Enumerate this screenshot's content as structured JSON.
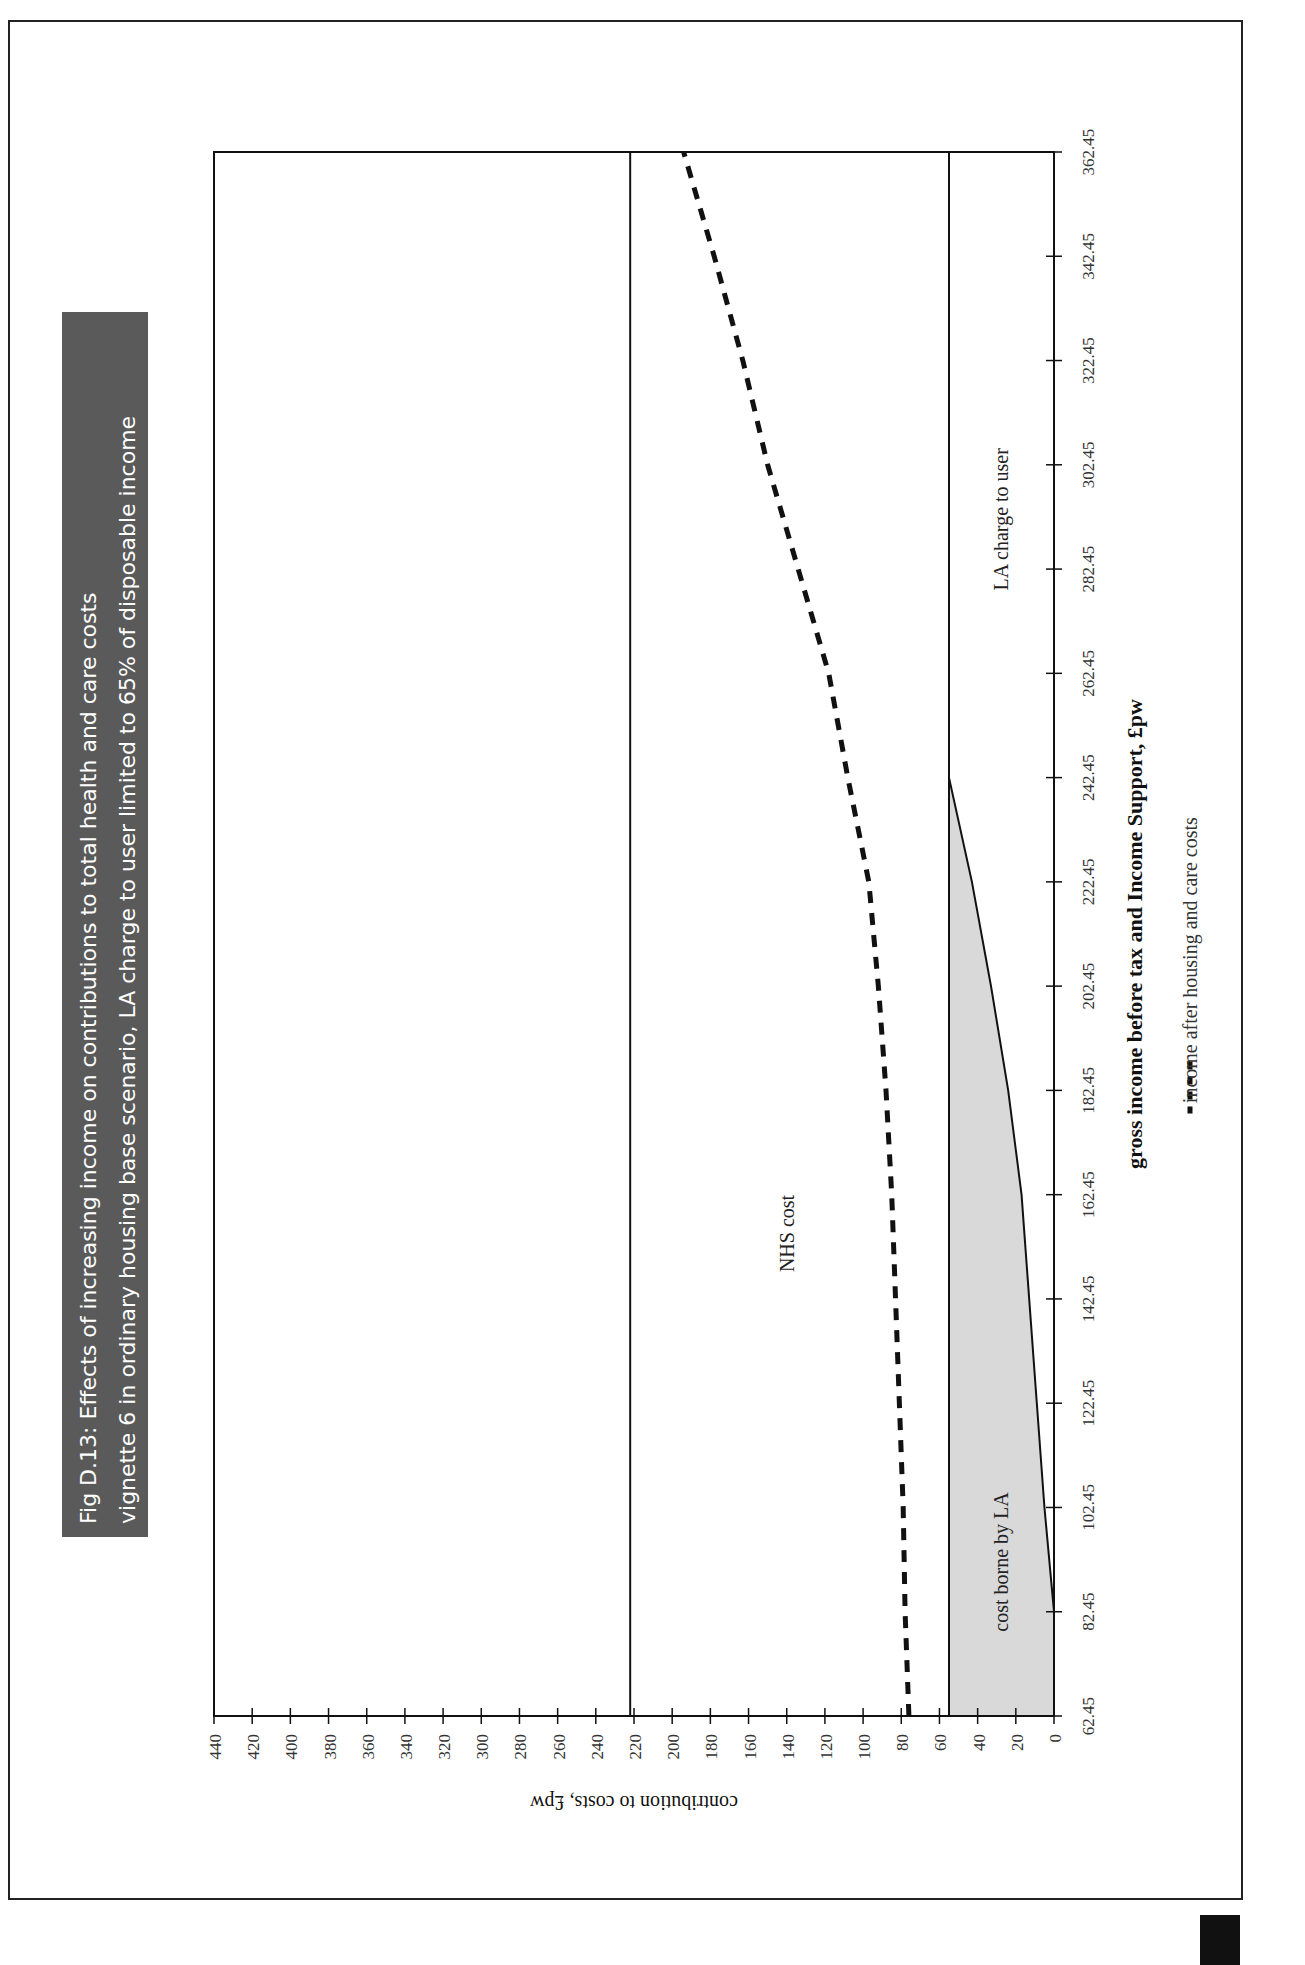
{
  "figure": {
    "title_line1": "Fig D.13:  Effects of increasing income on contributions to total health and care costs",
    "title_line2": "vignette 6 in ordinary housing base scenario, LA charge to user limited to 65% of disposable income",
    "title_bg_color": "#5a5a5a",
    "title_text_color": "#ffffff"
  },
  "labels": {
    "nhs_cost": "NHS cost",
    "la_charge": "LA charge to user",
    "cost_borne_by_la": "cost borne by LA",
    "legend_dashed": "income after housing and care costs",
    "legend_symbol": "- - - -"
  },
  "chart_data": {
    "type": "area",
    "orientation": "rotated 90° counter-clockwise on page",
    "title": "Fig D.13: Effects of increasing income on contributions to total health and care costs vignette 6 in ordinary housing base scenario, LA charge to user limited to 65% of disposable income",
    "xlabel": "gross income before tax and Income Support, £pw",
    "ylabel": "contribution to costs, £pw",
    "x_ticks": [
      "62.45",
      "82.45",
      "102.45",
      "122.45",
      "142.45",
      "162.45",
      "182.45",
      "202.45",
      "222.45",
      "242.45",
      "262.45",
      "282.45",
      "302.45",
      "322.45",
      "342.45",
      "362.45"
    ],
    "y_ticks": [
      "0",
      "20",
      "40",
      "60",
      "80",
      "100",
      "120",
      "140",
      "160",
      "180",
      "200",
      "220",
      "240",
      "260",
      "280",
      "300",
      "320",
      "340",
      "360",
      "380",
      "400",
      "420",
      "440"
    ],
    "xlim": [
      62.45,
      362.45
    ],
    "ylim": [
      0,
      440
    ],
    "x": [
      62.45,
      82.45,
      102.45,
      122.45,
      142.45,
      162.45,
      182.45,
      202.45,
      222.45,
      242.45,
      262.45,
      282.45,
      302.45,
      322.45,
      342.45,
      362.45
    ],
    "series": [
      {
        "name": "LA charge to user",
        "style": "solid line (boundary of shaded area)",
        "values": [
          0,
          0,
          5,
          9,
          13,
          17,
          24,
          33,
          43,
          55,
          55,
          55,
          55,
          55,
          55,
          55
        ]
      },
      {
        "name": "total care cost (LA charge + cost borne by LA)",
        "style": "solid horizontal line",
        "values": [
          55,
          55,
          55,
          55,
          55,
          55,
          55,
          55,
          55,
          55,
          55,
          55,
          55,
          55,
          55,
          55
        ]
      },
      {
        "name": "NHS cost (top of NHS band)",
        "style": "solid horizontal line",
        "values": [
          222,
          222,
          222,
          222,
          222,
          222,
          222,
          222,
          222,
          222,
          222,
          222,
          222,
          222,
          222,
          222
        ]
      },
      {
        "name": "income after housing and care costs",
        "style": "dashed",
        "values": [
          76,
          78,
          79,
          81,
          83,
          85,
          88,
          92,
          97,
          108,
          118,
          134,
          150,
          163,
          178,
          194
        ]
      }
    ],
    "regions": [
      {
        "name": "cost borne by LA",
        "fill": "#d9d9d9"
      },
      {
        "name": "LA charge to user",
        "fill": "#ffffff"
      },
      {
        "name": "NHS cost",
        "fill": "#ffffff"
      }
    ],
    "legend": [
      "income after housing and care costs"
    ],
    "grid": false
  }
}
